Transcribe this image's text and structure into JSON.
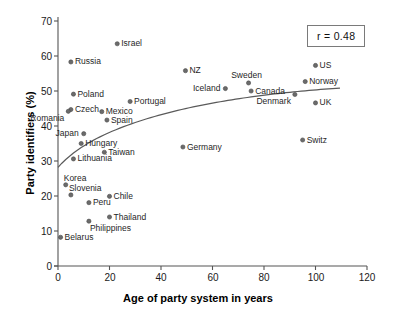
{
  "chart_data": {
    "type": "scatter",
    "title": "",
    "xlabel": "Age of party system in years",
    "ylabel": "Party identifiers (%)",
    "xlim": [
      0,
      120
    ],
    "ylim": [
      0,
      70
    ],
    "xticks": [
      0,
      20,
      40,
      60,
      80,
      100,
      120
    ],
    "yticks": [
      0,
      10,
      20,
      30,
      40,
      50,
      60,
      70
    ],
    "grid": false,
    "legend": false,
    "annotation": "r = 0.48",
    "correlation": 0.48,
    "marker_color": "#6b6b6b",
    "trend_color": "#5a5a5a",
    "trend_note": "logarithmic fit curve rising from ~28% at x=0 to ~49% plateau near x=85, easing to ~47% at x=110",
    "points": [
      {
        "label": "Israel",
        "x": 23,
        "y": 63.5,
        "side": "right"
      },
      {
        "label": "Russia",
        "x": 5,
        "y": 58.3,
        "side": "right"
      },
      {
        "label": "US",
        "x": 100,
        "y": 57.3,
        "side": "right"
      },
      {
        "label": "NZ",
        "x": 49.5,
        "y": 55.8,
        "side": "right"
      },
      {
        "label": "Norway",
        "x": 96,
        "y": 52.7,
        "side": "right"
      },
      {
        "label": "Sweden",
        "x": 74,
        "y": 52.3,
        "side": "above"
      },
      {
        "label": "Iceland",
        "x": 65,
        "y": 50.7,
        "side": "left"
      },
      {
        "label": "Canada",
        "x": 75,
        "y": 50.0,
        "side": "right"
      },
      {
        "label": "Poland",
        "x": 6,
        "y": 49.1,
        "side": "right"
      },
      {
        "label": "Denmark",
        "x": 92,
        "y": 49.0,
        "side": "below-left"
      },
      {
        "label": "Portugal",
        "x": 28,
        "y": 47.0,
        "side": "right"
      },
      {
        "label": "UK",
        "x": 100,
        "y": 46.6,
        "side": "right"
      },
      {
        "label": "Czech",
        "x": 5,
        "y": 44.7,
        "side": "right"
      },
      {
        "label": "Romania",
        "x": 4,
        "y": 44.2,
        "side": "below-left"
      },
      {
        "label": "Mexico",
        "x": 17,
        "y": 44.1,
        "side": "right"
      },
      {
        "label": "Spain",
        "x": 19,
        "y": 41.7,
        "side": "right"
      },
      {
        "label": "Japan",
        "x": 10,
        "y": 37.8,
        "side": "left"
      },
      {
        "label": "Switz",
        "x": 95,
        "y": 36.0,
        "side": "right"
      },
      {
        "label": "Hungary",
        "x": 9,
        "y": 35.0,
        "side": "right"
      },
      {
        "label": "Germany",
        "x": 48.5,
        "y": 34.0,
        "side": "right"
      },
      {
        "label": "Taiwan",
        "x": 18,
        "y": 32.5,
        "side": "right"
      },
      {
        "label": "Lithuania",
        "x": 6,
        "y": 30.6,
        "side": "right"
      },
      {
        "label": "Korea",
        "x": 3,
        "y": 23.2,
        "side": "above-right"
      },
      {
        "label": "Slovenia",
        "x": 5,
        "y": 20.3,
        "side": "above-right"
      },
      {
        "label": "Chile",
        "x": 20,
        "y": 19.9,
        "side": "right"
      },
      {
        "label": "Peru",
        "x": 12,
        "y": 18.1,
        "side": "right"
      },
      {
        "label": "Thailand",
        "x": 20,
        "y": 14.0,
        "side": "right"
      },
      {
        "label": "Philippines",
        "x": 12,
        "y": 12.8,
        "side": "below-right"
      },
      {
        "label": "Belarus",
        "x": 1,
        "y": 8.2,
        "side": "right"
      }
    ]
  },
  "labels": {
    "annotation": "r = 0.48",
    "xlabel": "Age of party system in years",
    "ylabel": "Party identifiers (%)",
    "p0": "Israel",
    "p1": "Russia",
    "p2": "US",
    "p3": "NZ",
    "p4": "Norway",
    "p5": "Sweden",
    "p6": "Iceland",
    "p7": "Canada",
    "p8": "Poland",
    "p9": "Denmark",
    "p10": "Portugal",
    "p11": "UK",
    "p12": "Czech",
    "p13": "Romania",
    "p14": "Mexico",
    "p15": "Spain",
    "p16": "Japan",
    "p17": "Switz",
    "p18": "Hungary",
    "p19": "Germany",
    "p20": "Taiwan",
    "p21": "Lithuania",
    "p22": "Korea",
    "p23": "Slovenia",
    "p24": "Chile",
    "p25": "Peru",
    "p26": "Thailand",
    "p27": "Philippines",
    "p28": "Belarus",
    "x0": "0",
    "x1": "20",
    "x2": "40",
    "x3": "60",
    "x4": "80",
    "x5": "100",
    "x6": "120",
    "y0": "0",
    "y1": "10",
    "y2": "20",
    "y3": "30",
    "y4": "40",
    "y5": "50",
    "y6": "60",
    "y7": "70"
  }
}
